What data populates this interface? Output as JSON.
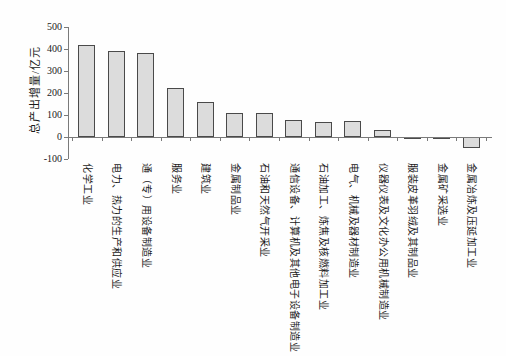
{
  "chart_data": {
    "type": "bar",
    "title": "",
    "xlabel": "",
    "ylabel": "总产出增量/亿元",
    "ylim": [
      -100,
      500
    ],
    "yticks": [
      500,
      400,
      300,
      200,
      100,
      0,
      -100
    ],
    "grid": false,
    "legend_position": "none",
    "categories": [
      "化学工业",
      "电力、热力的生产和供应业",
      "通（专）用设备制造业",
      "服务业",
      "建筑业",
      "金属制品业",
      "石油和天然气开采业",
      "通信设备、计算机及其他电子设备制造业",
      "石油加工、炼焦及核燃料加工业",
      "电气、机械及器材制造业",
      "仪器仪表及文化办公用机械制造业",
      "服装皮革羽绒及其制品业",
      "金属矿采选业",
      "金属冶炼及压延加工业"
    ],
    "values": [
      418,
      391,
      383,
      222,
      158,
      110,
      108,
      79,
      70,
      72,
      30,
      -4,
      -8,
      -48
    ],
    "colors": {
      "bar_fill": "#dcdcdc",
      "bar_border": "#4a4a4a",
      "axis": "#7a7a7a",
      "text": "#1a1a1a",
      "background": "#fefefe"
    }
  }
}
